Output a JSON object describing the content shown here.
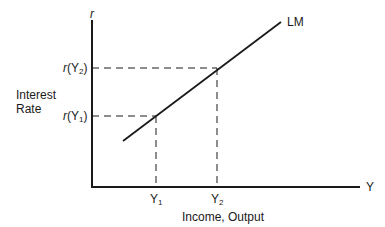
{
  "diagram": {
    "y_axis": {
      "symbol": "r",
      "label_line1": "Interest",
      "label_line2": "Rate"
    },
    "x_axis": {
      "symbol": "Y",
      "label": "Income, Output"
    },
    "curve": {
      "label": "LM"
    },
    "points": [
      {
        "x_label": "Y",
        "x_sub": "1",
        "y_label_fn": "r",
        "y_label_arg": "Y",
        "y_label_sub": "1"
      },
      {
        "x_label": "Y",
        "x_sub": "2",
        "y_label_fn": "r",
        "y_label_arg": "Y",
        "y_label_sub": "2"
      }
    ],
    "colors": {
      "line": "#1a1a1a",
      "background": "#ffffff"
    }
  }
}
